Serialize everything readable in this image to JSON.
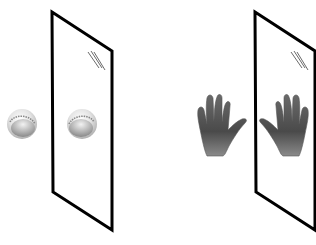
{
  "figure": {
    "colors": {
      "background": "#ffffff",
      "mirror_frame": "#000000",
      "skin_dark": "#3e3e3e",
      "skin_light": "#9a9a9a",
      "ball_light": "#f4f4f4",
      "ball_dark": "#8a8a8a"
    },
    "panels": [
      {
        "name": "baseball-panel",
        "object": "baseball",
        "object_icon": "baseball-icon",
        "reflection_icon": "baseball-reflection-icon",
        "mirror_icon": "mirror-icon"
      },
      {
        "name": "hand-panel",
        "object": "hand",
        "object_icon": "left-hand-icon",
        "reflection_icon": "right-hand-reflection-icon",
        "mirror_icon": "mirror-icon"
      }
    ]
  }
}
